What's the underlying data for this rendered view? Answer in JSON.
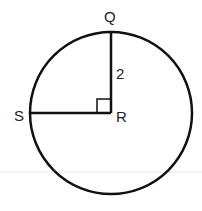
{
  "diagram": {
    "type": "circle-with-radii",
    "points": {
      "Q": "Q",
      "R": "R",
      "S": "S"
    },
    "center": "R",
    "radius_label": "2",
    "right_angle_at": "R",
    "segments": [
      "RQ",
      "RS"
    ],
    "colors": {
      "stroke": "#111111",
      "label": "#222222",
      "background": "#ffffff"
    }
  }
}
